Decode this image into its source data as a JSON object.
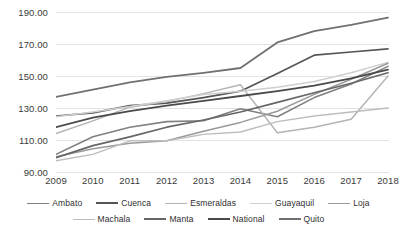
{
  "chart_data": {
    "type": "line",
    "title": "",
    "xlabel": "",
    "ylabel": "",
    "categories": [
      "2009",
      "2010",
      "2011",
      "2012",
      "2013",
      "2014",
      "2015",
      "2016",
      "2017",
      "2018"
    ],
    "x": [
      2009,
      2010,
      2011,
      2012,
      2013,
      2014,
      2015,
      2016,
      2017,
      2018
    ],
    "ylim": [
      90,
      190
    ],
    "yticks": [
      "90.00",
      "110.00",
      "130.00",
      "150.00",
      "170.00",
      "190.00"
    ],
    "ytick_values": [
      90,
      110,
      130,
      150,
      170,
      190
    ],
    "grid": true,
    "legend_position": "bottom",
    "series": [
      {
        "name": "Ambato",
        "color": "#808080",
        "width": 1.6,
        "values": [
          101.0,
          112.0,
          118.0,
          121.5,
          122.0,
          129.5,
          124.5,
          136.5,
          145.0,
          156.0
        ]
      },
      {
        "name": "Cuenca",
        "color": "#555555",
        "width": 1.7,
        "values": [
          125.0,
          127.0,
          131.5,
          133.0,
          136.5,
          140.5,
          151.5,
          163.0,
          165.0,
          167.0
        ]
      },
      {
        "name": "Esmeraldas",
        "color": "#b3b3b3",
        "width": 1.4,
        "values": [
          114.0,
          122.0,
          130.5,
          134.0,
          139.0,
          144.5,
          114.5,
          118.0,
          123.0,
          150.0
        ]
      },
      {
        "name": "Guayaquil",
        "color": "#cfcfcf",
        "width": 1.5,
        "values": [
          124.5,
          127.5,
          131.0,
          134.5,
          138.5,
          140.5,
          143.0,
          146.5,
          152.0,
          158.5
        ]
      },
      {
        "name": "Loja",
        "color": "#9a9a9a",
        "width": 1.5,
        "values": [
          99.5,
          104.5,
          108.0,
          109.5,
          115.5,
          121.0,
          128.0,
          138.5,
          148.0,
          158.0
        ]
      },
      {
        "name": "Machala",
        "color": "#bdbdbd",
        "width": 1.4,
        "values": [
          97.0,
          101.0,
          109.5,
          109.5,
          113.5,
          115.0,
          121.5,
          125.0,
          127.5,
          130.0
        ]
      },
      {
        "name": "Manta",
        "color": "#666666",
        "width": 1.7,
        "values": [
          99.0,
          106.5,
          112.0,
          118.0,
          122.5,
          127.5,
          133.5,
          139.5,
          145.5,
          152.0
        ]
      },
      {
        "name": "National",
        "color": "#4a4a4a",
        "width": 1.8,
        "values": [
          118.0,
          124.0,
          128.0,
          131.5,
          134.5,
          137.5,
          140.5,
          144.0,
          148.5,
          154.0
        ]
      },
      {
        "name": "Quito",
        "color": "#707070",
        "width": 1.8,
        "values": [
          137.0,
          141.5,
          146.0,
          149.5,
          152.0,
          155.0,
          171.0,
          178.0,
          182.0,
          186.5
        ]
      }
    ],
    "legend_rows": [
      [
        "Ambato",
        "Cuenca",
        "Esmeraldas",
        "Guayaquil",
        "Loja"
      ],
      [
        "Machala",
        "Manta",
        "National",
        "Quito"
      ]
    ]
  }
}
